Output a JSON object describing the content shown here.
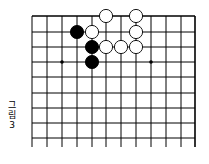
{
  "caption": {
    "line1": "그",
    "line2": "림",
    "line3": "3"
  },
  "board": {
    "x_lines": [
      32,
      47,
      62,
      77,
      92,
      106,
      121,
      136,
      151,
      166,
      181,
      195
    ],
    "y_lines": [
      16,
      32,
      47,
      62,
      77,
      93,
      108,
      123,
      138
    ],
    "bottom_extent": 147,
    "line_color": "#000000",
    "star_points": [
      [
        62,
        62
      ],
      [
        151,
        62
      ]
    ],
    "stones": [
      {
        "color": "white",
        "x": 106,
        "y": 16
      },
      {
        "color": "white",
        "x": 136,
        "y": 16
      },
      {
        "color": "black",
        "x": 77,
        "y": 32
      },
      {
        "color": "white",
        "x": 92,
        "y": 32
      },
      {
        "color": "white",
        "x": 136,
        "y": 32
      },
      {
        "color": "black",
        "x": 92,
        "y": 47
      },
      {
        "color": "white",
        "x": 106,
        "y": 47
      },
      {
        "color": "white",
        "x": 121,
        "y": 47
      },
      {
        "color": "white",
        "x": 136,
        "y": 47
      },
      {
        "color": "black",
        "x": 92,
        "y": 62
      }
    ]
  }
}
